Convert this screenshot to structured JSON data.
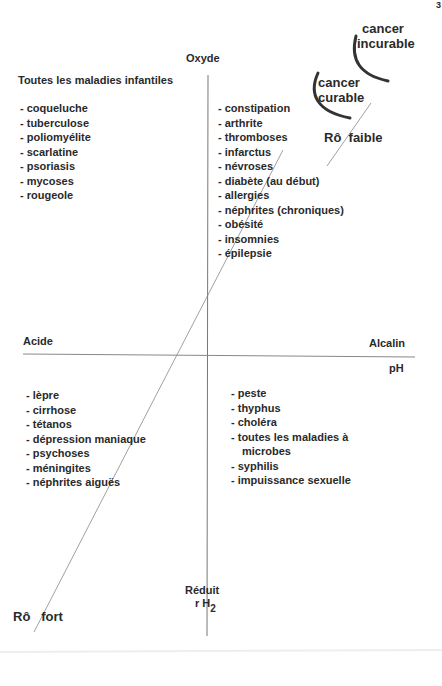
{
  "page_marker": "3",
  "axes": {
    "vertical": {
      "top_label": "Oxyde",
      "bottom_label": "Réduit",
      "unit_main": "r H",
      "unit_sub": "2"
    },
    "horizontal": {
      "left_label": "Acide",
      "right_label": "Alcalin",
      "unit": "pH"
    },
    "diagonal": {
      "top_label": "Rô  faible",
      "bottom_label": "Rô   fort"
    }
  },
  "cancer": {
    "curable": [
      "cancer",
      "curable"
    ],
    "incurable": [
      "cancer",
      "incurable"
    ]
  },
  "quadrants": {
    "top_left": {
      "title": "Toutes les maladies infantiles",
      "items": [
        "- coqueluche",
        "- tuberculose",
        "- poliomyélite",
        "- scarlatine",
        "- psoriasis",
        "- mycoses",
        "- rougeole"
      ]
    },
    "top_right": {
      "items": [
        "- constipation",
        "- arthrite",
        "- thromboses",
        "- infarctus",
        "- névroses",
        "- diabète (au début)",
        "- allergies",
        "- néphrites (chroniques)",
        "- obésité",
        "- insomnies",
        "- épilepsie"
      ]
    },
    "bottom_left": {
      "items": [
        "- lèpre",
        "- cirrhose",
        "- tétanos",
        "- dépression maniaque",
        "- psychoses",
        "- méningites",
        "- néphrites aiguës"
      ]
    },
    "bottom_right": {
      "items": [
        "- peste",
        "- thyphus",
        "- choléra",
        "- toutes les maladies à",
        "microbes",
        "- syphilis",
        "- impuissance sexuelle"
      ]
    }
  }
}
